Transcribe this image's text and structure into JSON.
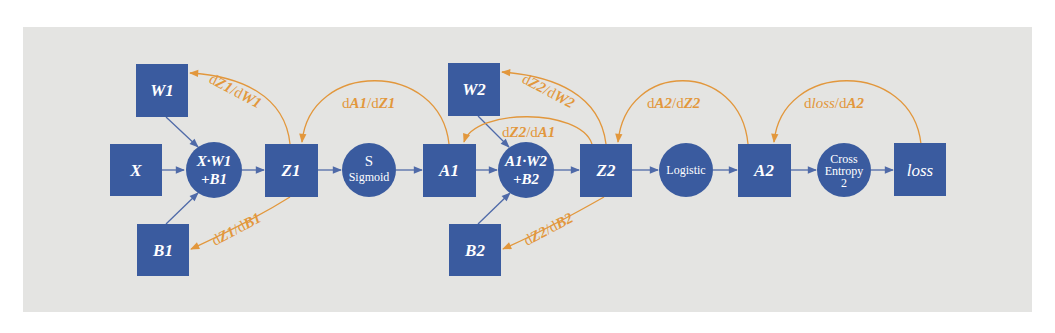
{
  "diagram": {
    "colors": {
      "node": "#3a5b9f",
      "forward_edge": "#4f6aa8",
      "backward_edge": "#e2973c",
      "panel_background": "#e4e4e2"
    },
    "nodes": {
      "X": "X",
      "W1": "W1",
      "B1": "B1",
      "op1_line1": "X·W1",
      "op1_line2": "+B1",
      "Z1": "Z1",
      "sigmoid_line1": "S",
      "sigmoid_line2": "Sigmoid",
      "A1": "A1",
      "W2": "W2",
      "B2": "B2",
      "op2_line1": "A1·W2",
      "op2_line2": "+B2",
      "Z2": "Z2",
      "logistic": "Logistic",
      "A2": "A2",
      "ce_line1": "Cross",
      "ce_line2": "Entropy",
      "ce_line3": "2",
      "loss": "loss"
    },
    "gradients": {
      "dZ1_dW1": {
        "d1": "d",
        "v1": "Z1",
        "sep": "/d",
        "v2": "W1"
      },
      "dZ1_dB1": {
        "d1": "d",
        "v1": "Z1",
        "sep": "/d",
        "v2": "B1"
      },
      "dA1_dZ1": {
        "d1": "d",
        "v1": "A1",
        "sep": "/d",
        "v2": "Z1"
      },
      "dZ2_dW2": {
        "d1": "d",
        "v1": "Z2",
        "sep": "/d",
        "v2": "W2"
      },
      "dZ2_dA1": {
        "d1": "d",
        "v1": "Z2",
        "sep": "/d",
        "v2": "A1"
      },
      "dZ2_dB2": {
        "d1": "d",
        "v1": "Z2",
        "sep": "/d",
        "v2": "B2"
      },
      "dA2_dZ2": {
        "d1": "d",
        "v1": "A2",
        "sep": "/d",
        "v2": "Z2"
      },
      "dloss_dA2": {
        "d1": "d",
        "v1": "loss",
        "sep": "/d",
        "v2": "A2"
      }
    }
  }
}
